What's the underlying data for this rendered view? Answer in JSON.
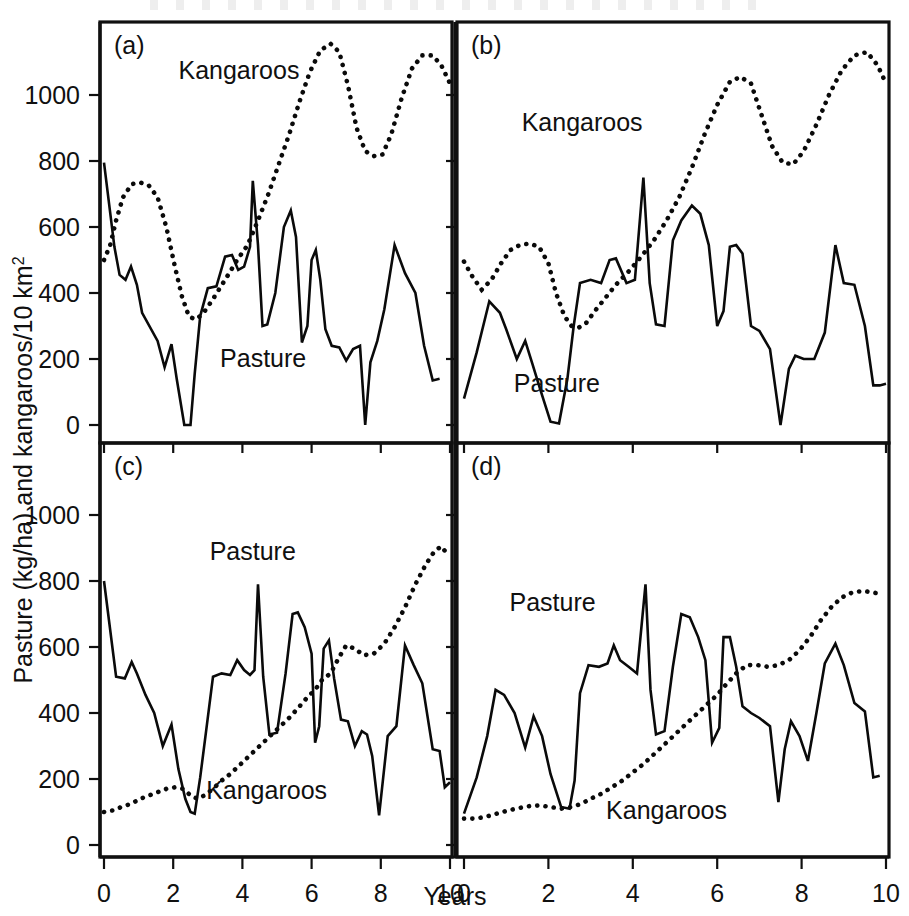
{
  "figure": {
    "y_axis_label_main": "Pasture (kg/ha) and kangaroos/10 km",
    "y_axis_label_sup": "2",
    "x_axis_label": "Years",
    "y_ticks": [
      0,
      200,
      400,
      600,
      800,
      1000
    ],
    "x_ticks": [
      0,
      2,
      4,
      6,
      8,
      10
    ],
    "ylim": [
      -60,
      1180
    ],
    "xlim": [
      0,
      10
    ]
  },
  "chart_data": {
    "type": "line",
    "title": "",
    "xlabel": "Years",
    "ylabel": "Pasture (kg/ha) and kangaroos/10 km2",
    "xlim": [
      0,
      10
    ],
    "ylim": [
      0,
      1180
    ],
    "grid": false,
    "legend": "inline-annotations",
    "panels": [
      {
        "id": "a",
        "label": "(a)",
        "annotations": [
          {
            "text": "Kangaroos",
            "x": 3.9,
            "y": 1048
          },
          {
            "text": "Pasture",
            "x": 4.6,
            "y": 175
          }
        ],
        "series": [
          {
            "name": "Pasture",
            "style": "solid",
            "x": [
              0.0,
              0.3,
              0.45,
              0.62,
              0.78,
              0.95,
              1.1,
              1.55,
              1.75,
              1.95,
              2.1,
              2.32,
              2.5,
              2.62,
              2.78,
              3.0,
              3.25,
              3.5,
              3.7,
              3.88,
              4.05,
              4.22,
              4.3,
              4.45,
              4.58,
              4.72,
              4.95,
              5.2,
              5.4,
              5.55,
              5.72,
              5.88,
              6.0,
              6.12,
              6.25,
              6.4,
              6.58,
              6.8,
              7.0,
              7.2,
              7.4,
              7.55,
              7.7,
              7.9,
              8.1,
              8.4,
              8.7,
              9.0,
              9.25,
              9.5,
              9.7,
              9.85,
              10.0
            ],
            "y": [
              795,
              540,
              455,
              440,
              480,
              425,
              340,
              255,
              175,
              245,
              140,
              0,
              0,
              155,
              330,
              415,
              420,
              510,
              515,
              470,
              480,
              540,
              740,
              545,
              300,
              305,
              400,
              600,
              650,
              570,
              250,
              300,
              500,
              530,
              440,
              290,
              240,
              235,
              195,
              230,
              240,
              0,
              190,
              255,
              350,
              545,
              460,
              400,
              240,
              135,
              140
            ]
          },
          {
            "name": "Kangaroos",
            "style": "dotted",
            "x": [
              0.0,
              0.18,
              0.35,
              0.55,
              0.8,
              1.05,
              1.3,
              1.55,
              1.8,
              2.05,
              2.25,
              2.45,
              2.62,
              2.78,
              2.95,
              3.2,
              3.5,
              3.85,
              4.15,
              4.45,
              4.75,
              5.05,
              5.35,
              5.65,
              5.95,
              6.25,
              6.55,
              6.8,
              7.05,
              7.3,
              7.55,
              7.8,
              8.05,
              8.3,
              8.6,
              8.9,
              9.2,
              9.5,
              9.75,
              10.0
            ],
            "y": [
              500,
              545,
              620,
              690,
              730,
              735,
              725,
              690,
              600,
              480,
              390,
              330,
              320,
              330,
              350,
              390,
              440,
              500,
              545,
              620,
              700,
              790,
              880,
              980,
              1070,
              1135,
              1155,
              1130,
              1030,
              900,
              830,
              815,
              820,
              880,
              990,
              1080,
              1120,
              1120,
              1090,
              1035
            ]
          }
        ]
      },
      {
        "id": "b",
        "label": "(b)",
        "annotations": [
          {
            "text": "Kangaroos",
            "x": 2.8,
            "y": 890
          },
          {
            "text": "Pasture",
            "x": 2.2,
            "y": 100
          }
        ],
        "series": [
          {
            "name": "Pasture",
            "style": "solid",
            "x": [
              0.0,
              0.3,
              0.6,
              0.85,
              1.0,
              1.25,
              1.45,
              1.62,
              1.8,
              2.05,
              2.25,
              2.45,
              2.6,
              2.75,
              3.0,
              3.25,
              3.45,
              3.6,
              3.85,
              4.05,
              4.25,
              4.4,
              4.55,
              4.75,
              4.95,
              5.15,
              5.4,
              5.6,
              5.8,
              6.0,
              6.15,
              6.3,
              6.45,
              6.6,
              6.8,
              7.0,
              7.25,
              7.5,
              7.7,
              7.85,
              8.05,
              8.3,
              8.55,
              8.8,
              9.0,
              9.25,
              9.5,
              9.7,
              9.85,
              10.0
            ],
            "y": [
              80,
              220,
              375,
              340,
              290,
              200,
              255,
              185,
              110,
              10,
              5,
              140,
              300,
              430,
              440,
              430,
              500,
              505,
              430,
              440,
              750,
              430,
              305,
              300,
              560,
              620,
              665,
              640,
              545,
              300,
              345,
              540,
              545,
              520,
              300,
              285,
              230,
              0,
              170,
              210,
              200,
              200,
              280,
              545,
              430,
              425,
              300,
              120,
              120,
              125
            ]
          },
          {
            "name": "Kangaroos",
            "style": "dotted",
            "x": [
              0.0,
              0.2,
              0.42,
              0.65,
              0.88,
              1.1,
              1.32,
              1.55,
              1.78,
              2.0,
              2.18,
              2.38,
              2.55,
              2.72,
              2.9,
              3.1,
              3.35,
              3.6,
              3.9,
              4.2,
              4.5,
              4.8,
              5.1,
              5.4,
              5.7,
              6.0,
              6.3,
              6.55,
              6.8,
              7.05,
              7.3,
              7.55,
              7.8,
              8.05,
              8.35,
              8.65,
              8.95,
              9.25,
              9.55,
              9.8,
              10.0
            ],
            "y": [
              495,
              450,
              410,
              440,
              490,
              530,
              545,
              550,
              540,
              490,
              400,
              330,
              300,
              295,
              310,
              345,
              385,
              425,
              465,
              510,
              560,
              620,
              690,
              780,
              880,
              970,
              1040,
              1055,
              1035,
              940,
              845,
              795,
              790,
              830,
              910,
              1000,
              1075,
              1120,
              1130,
              1090,
              1035
            ]
          }
        ]
      },
      {
        "id": "c",
        "label": "(c)",
        "annotations": [
          {
            "text": "Pasture",
            "x": 4.3,
            "y": 865
          },
          {
            "text": "Kangaroos",
            "x": 4.7,
            "y": 140
          }
        ],
        "series": [
          {
            "name": "Pasture",
            "style": "solid",
            "x": [
              0.0,
              0.35,
              0.6,
              0.8,
              0.95,
              1.2,
              1.45,
              1.7,
              1.95,
              2.15,
              2.35,
              2.5,
              2.62,
              2.78,
              2.95,
              3.15,
              3.4,
              3.65,
              3.85,
              4.05,
              4.22,
              4.35,
              4.45,
              4.6,
              4.78,
              5.0,
              5.25,
              5.45,
              5.6,
              5.8,
              6.0,
              6.1,
              6.22,
              6.35,
              6.5,
              6.65,
              6.85,
              7.05,
              7.25,
              7.45,
              7.6,
              7.75,
              7.95,
              8.2,
              8.45,
              8.7,
              8.95,
              9.2,
              9.5,
              9.7,
              9.85,
              10.0
            ],
            "y": [
              800,
              510,
              505,
              555,
              520,
              455,
              400,
              300,
              365,
              230,
              140,
              100,
              95,
              205,
              345,
              510,
              520,
              515,
              560,
              530,
              515,
              530,
              790,
              510,
              335,
              340,
              520,
              700,
              705,
              660,
              580,
              310,
              360,
              595,
              620,
              505,
              380,
              375,
              300,
              345,
              335,
              270,
              90,
              330,
              360,
              605,
              545,
              490,
              290,
              285,
              175,
              190
            ]
          },
          {
            "name": "Kangaroos",
            "style": "dotted",
            "x": [
              0.0,
              0.25,
              0.5,
              0.78,
              1.05,
              1.3,
              1.55,
              1.8,
              2.05,
              2.3,
              2.5,
              2.7,
              2.9,
              3.15,
              3.4,
              3.65,
              3.9,
              4.15,
              4.4,
              4.65,
              4.9,
              5.15,
              5.4,
              5.65,
              5.9,
              6.1,
              6.3,
              6.55,
              6.8,
              7.0,
              7.25,
              7.5,
              7.8,
              8.1,
              8.4,
              8.7,
              9.0,
              9.3,
              9.55,
              9.75,
              9.9
            ],
            "y": [
              100,
              105,
              115,
              125,
              140,
              150,
              160,
              170,
              175,
              170,
              150,
              140,
              150,
              170,
              195,
              215,
              240,
              265,
              290,
              315,
              340,
              365,
              390,
              420,
              450,
              470,
              500,
              520,
              570,
              605,
              595,
              575,
              580,
              610,
              660,
              720,
              790,
              850,
              890,
              905,
              885
            ]
          }
        ]
      },
      {
        "id": "d",
        "label": "(d)",
        "annotations": [
          {
            "text": "Pasture",
            "x": 2.1,
            "y": 710
          },
          {
            "text": "Kangaroos",
            "x": 4.8,
            "y": 80
          }
        ],
        "series": [
          {
            "name": "Pasture",
            "style": "solid",
            "x": [
              0.0,
              0.3,
              0.55,
              0.75,
              0.95,
              1.2,
              1.45,
              1.65,
              1.85,
              2.05,
              2.3,
              2.5,
              2.62,
              2.75,
              2.95,
              3.2,
              3.4,
              3.55,
              3.7,
              3.9,
              4.1,
              4.3,
              4.42,
              4.55,
              4.75,
              4.95,
              5.15,
              5.35,
              5.55,
              5.72,
              5.88,
              6.05,
              6.15,
              6.3,
              6.45,
              6.6,
              6.8,
              7.0,
              7.25,
              7.45,
              7.6,
              7.75,
              7.95,
              8.15,
              8.35,
              8.55,
              8.8,
              9.0,
              9.25,
              9.5,
              9.7,
              9.85,
              10.0
            ],
            "y": [
              95,
              205,
              330,
              470,
              455,
              400,
              295,
              390,
              330,
              215,
              115,
              110,
              195,
              460,
              545,
              540,
              550,
              605,
              560,
              540,
              520,
              790,
              470,
              335,
              345,
              540,
              700,
              690,
              630,
              560,
              310,
              355,
              630,
              630,
              540,
              420,
              400,
              385,
              360,
              130,
              290,
              375,
              330,
              255,
              400,
              550,
              610,
              545,
              430,
              405,
              205,
              210
            ]
          },
          {
            "name": "Kangaroos",
            "style": "dotted",
            "x": [
              0.0,
              0.25,
              0.5,
              0.78,
              1.05,
              1.3,
              1.55,
              1.8,
              2.05,
              2.3,
              2.55,
              2.78,
              3.0,
              3.25,
              3.5,
              3.75,
              4.0,
              4.25,
              4.5,
              4.75,
              5.0,
              5.25,
              5.5,
              5.75,
              6.0,
              6.2,
              6.45,
              6.7,
              6.95,
              7.2,
              7.45,
              7.7,
              7.95,
              8.2,
              8.45,
              8.7,
              8.95,
              9.2,
              9.45,
              9.7,
              9.9
            ],
            "y": [
              80,
              80,
              85,
              95,
              105,
              112,
              118,
              120,
              115,
              110,
              115,
              125,
              140,
              155,
              175,
              195,
              220,
              245,
              275,
              305,
              335,
              365,
              395,
              425,
              455,
              485,
              520,
              545,
              545,
              540,
              545,
              560,
              590,
              630,
              680,
              720,
              750,
              765,
              770,
              765,
              760
            ]
          }
        ]
      }
    ]
  }
}
